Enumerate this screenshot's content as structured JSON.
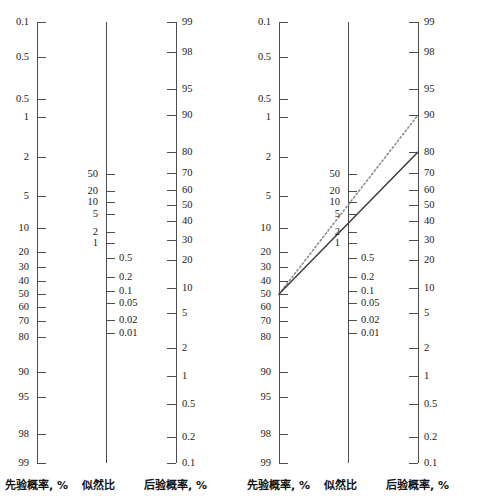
{
  "figure": {
    "type": "fagan-nomogram",
    "panel_count": 2,
    "background": "#ffffff",
    "ink_color": "#4d4d4d",
    "text_color": "#1a1a1a"
  },
  "captions": {
    "prior": "先验概率, %",
    "likelihood": "似然比",
    "posterior": "后验概率, %"
  },
  "chart_data": {
    "type": "line",
    "title": "",
    "xlabel": "",
    "ylabel": "",
    "grid": false,
    "legend": "none",
    "axes": [
      {
        "name": "prior-probability-axis",
        "caption": "先验概率, %",
        "unit": "%",
        "direction": "descending-downward",
        "x_px": 37,
        "tick_side": "right",
        "label_side": "left",
        "ticks": [
          {
            "label": "0.1",
            "y": 22
          },
          {
            "label": "0.5",
            "y": 57
          },
          {
            "label": "0.5",
            "y": 99
          },
          {
            "label": "1",
            "y": 117
          },
          {
            "label": "2",
            "y": 157
          },
          {
            "label": "5",
            "y": 196
          },
          {
            "label": "10",
            "y": 228
          },
          {
            "label": "20",
            "y": 252
          },
          {
            "label": "30",
            "y": 267
          },
          {
            "label": "40",
            "y": 281
          },
          {
            "label": "50",
            "y": 294
          },
          {
            "label": "60",
            "y": 307
          },
          {
            "label": "70",
            "y": 321
          },
          {
            "label": "80",
            "y": 337
          },
          {
            "label": "90",
            "y": 372
          },
          {
            "label": "95",
            "y": 397
          },
          {
            "label": "98",
            "y": 434
          },
          {
            "label": "99",
            "y": 463
          }
        ]
      },
      {
        "name": "likelihood-ratio-axis",
        "caption": "似然比",
        "unit": "",
        "direction": "descending-downward",
        "x_px": 106,
        "tick_side": "right",
        "ticks": [
          {
            "label": "50",
            "y": 174,
            "side": "left"
          },
          {
            "label": "20",
            "y": 191,
            "side": "left"
          },
          {
            "label": "10",
            "y": 202,
            "side": "left"
          },
          {
            "label": "5",
            "y": 214,
            "side": "left"
          },
          {
            "label": "2",
            "y": 232,
            "side": "left"
          },
          {
            "label": "1",
            "y": 243,
            "side": "left"
          },
          {
            "label": "0.5",
            "y": 258,
            "side": "right"
          },
          {
            "label": "0.2",
            "y": 277,
            "side": "right"
          },
          {
            "label": "0.1",
            "y": 291,
            "side": "right"
          },
          {
            "label": "0.05",
            "y": 303,
            "side": "right"
          },
          {
            "label": "0.02",
            "y": 320,
            "side": "right"
          },
          {
            "label": "0.01",
            "y": 333,
            "side": "right"
          }
        ],
        "line_top_y": 22,
        "line_bottom_y": 463
      },
      {
        "name": "posterior-probability-axis",
        "caption": "后验概率, %",
        "unit": "%",
        "direction": "ascending-downward",
        "x_px": 176,
        "tick_side": "left",
        "label_side": "right",
        "ticks": [
          {
            "label": "99",
            "y": 22
          },
          {
            "label": "98",
            "y": 52
          },
          {
            "label": "95",
            "y": 89
          },
          {
            "label": "90",
            "y": 115
          },
          {
            "label": "80",
            "y": 152
          },
          {
            "label": "70",
            "y": 173
          },
          {
            "label": "60",
            "y": 190
          },
          {
            "label": "50",
            "y": 205
          },
          {
            "label": "40",
            "y": 221
          },
          {
            "label": "30",
            "y": 240
          },
          {
            "label": "20",
            "y": 260
          },
          {
            "label": "10",
            "y": 288
          },
          {
            "label": "5",
            "y": 313
          },
          {
            "label": "2",
            "y": 348
          },
          {
            "label": "1",
            "y": 376
          },
          {
            "label": "0.5",
            "y": 404
          },
          {
            "label": "0.2",
            "y": 437
          },
          {
            "label": "0.1",
            "y": 463
          }
        ]
      }
    ],
    "panels": [
      {
        "name": "panel-blank",
        "index": 0,
        "rays": []
      },
      {
        "name": "panel-with-rays",
        "index": 1,
        "rays": [
          {
            "name": "dotted-ray",
            "style": "dotted",
            "color": "#8c8c8c",
            "prior_label": "50",
            "prior_y": 294,
            "likelihood_label": "10",
            "posterior_label": "90",
            "posterior_y": 115
          },
          {
            "name": "solid-ray",
            "style": "solid",
            "color": "#3d3d3d",
            "prior_label": "50",
            "prior_y": 294,
            "likelihood_label": "5",
            "posterior_label": "80",
            "posterior_y": 152
          }
        ]
      }
    ]
  }
}
